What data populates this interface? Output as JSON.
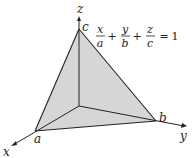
{
  "diagram": {
    "equation": {
      "terms": [
        {
          "numerator": "x",
          "denominator": "a"
        },
        {
          "numerator": "y",
          "denominator": "b"
        },
        {
          "numerator": "z",
          "denominator": "c"
        }
      ],
      "plus": "+",
      "equals": "=",
      "rhs": "1"
    },
    "axes": {
      "x_label": "x",
      "y_label": "y",
      "z_label": "z"
    },
    "intercepts": {
      "a_label": "a",
      "b_label": "b",
      "c_label": "c"
    },
    "colors": {
      "face_fill": "#d6d6d6",
      "line": "#222222",
      "background": "#ffffff"
    }
  }
}
